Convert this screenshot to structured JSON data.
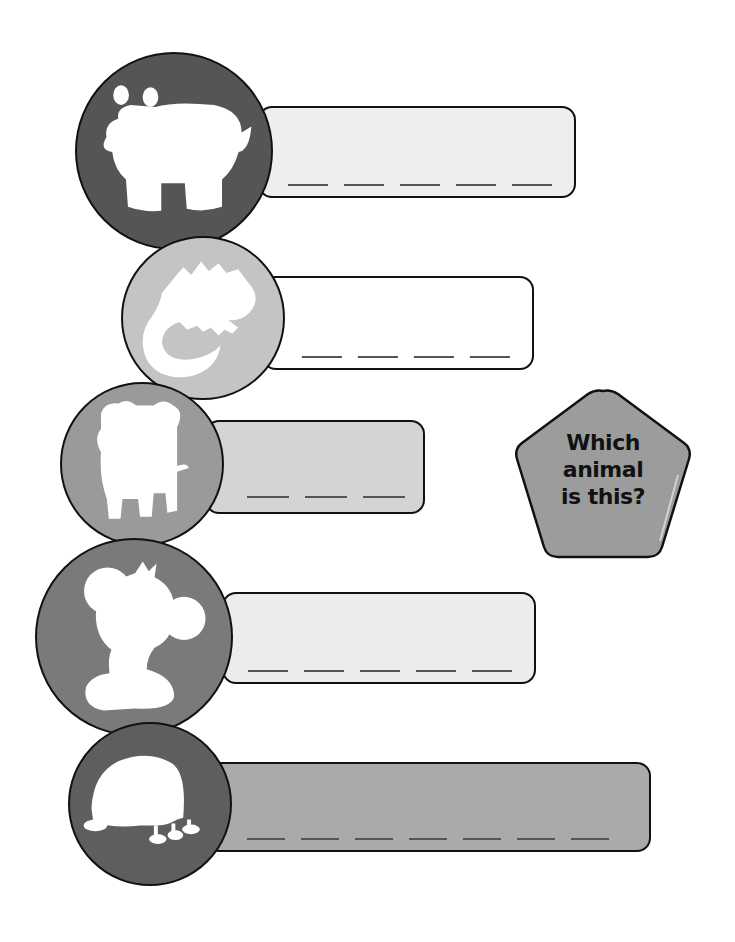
{
  "worksheet": {
    "prompt": {
      "line1": "Which",
      "line2": "animal",
      "line3": "is this?"
    },
    "rows": [
      {
        "animal_icon": "hippo-silhouette-icon",
        "circle_color": "#555555",
        "bar_color": "#eeeeee",
        "letter_blanks": 5
      },
      {
        "animal_icon": "lizard-silhouette-icon",
        "circle_color": "#c4c4c4",
        "bar_color": "#ffffff",
        "letter_blanks": 4
      },
      {
        "animal_icon": "pig-silhouette-icon",
        "circle_color": "#9a9a9a",
        "bar_color": "#d4d4d4",
        "letter_blanks": 3
      },
      {
        "animal_icon": "monkey-silhouette-icon",
        "circle_color": "#7a7a7a",
        "bar_color": "#ececec",
        "letter_blanks": 5
      },
      {
        "animal_icon": "turtle-silhouette-icon",
        "circle_color": "#5e5e5e",
        "bar_color": "#aaaaaa",
        "letter_blanks": 7
      }
    ],
    "badge_color": "#9c9c9c"
  }
}
